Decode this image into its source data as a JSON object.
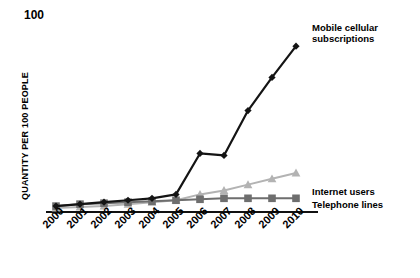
{
  "chart_data": {
    "type": "line",
    "title": "",
    "xlabel": "",
    "ylabel": "QUANTITY PER 100 PEOPLE",
    "categories": [
      "2000",
      "2001",
      "2002",
      "2003",
      "2004",
      "2005",
      "2006",
      "2007",
      "2008",
      "2009",
      "2010"
    ],
    "x": [
      2000,
      2001,
      2002,
      2003,
      2004,
      2005,
      2006,
      2007,
      2008,
      2009,
      2010
    ],
    "ylim": [
      0,
      100
    ],
    "yticks": [
      0,
      100
    ],
    "ytick_labels": [
      "0",
      "100"
    ],
    "grid": false,
    "legend_position": "line-end-annotations",
    "series": [
      {
        "name": "Mobile cellular subscriptions",
        "color": "#141414",
        "marker": "diamond",
        "values": [
          2,
          3,
          4,
          5,
          6,
          8,
          29,
          28,
          51,
          68,
          84
        ]
      },
      {
        "name": "Internet users",
        "color": "#b3b3b3",
        "marker": "triangle",
        "values": [
          1,
          1.5,
          2,
          3,
          4,
          5,
          8,
          10,
          13,
          16,
          19
        ]
      },
      {
        "name": "Telephone lines",
        "color": "#6e6e6e",
        "marker": "square",
        "values": [
          2,
          3,
          3.5,
          4,
          4.5,
          5,
          5.5,
          6,
          6,
          6,
          6
        ]
      }
    ]
  },
  "axis": {
    "y_title": "QUANTITY PER 100 PEOPLE",
    "y_top_label": "100",
    "y_bottom_label": "0"
  },
  "annotations": {
    "mobile_line1": "Mobile cellular",
    "mobile_line2": "subscriptions",
    "internet": "Internet users",
    "telephone": "Telephone lines"
  }
}
